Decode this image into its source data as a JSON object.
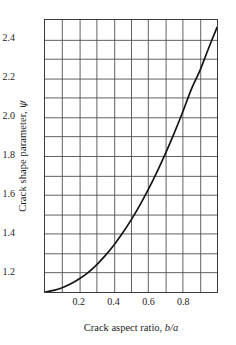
{
  "chart_data": {
    "type": "line",
    "title": "",
    "subtitle": "",
    "xlabel": "Crack aspect ratio, b/a",
    "xlabel_plain": "Crack aspect ratio, ",
    "xlabel_italic": "b/a",
    "ylabel": "Crack shape parameter, ψ",
    "ylabel_plain": "Crack shape parameter, ",
    "ylabel_symbol": "ψ",
    "xlim": [
      0,
      1.0
    ],
    "ylim": [
      1.1,
      2.5
    ],
    "grid": true,
    "grid_step_x": 0.1,
    "grid_step_y": 0.1,
    "legend": "none",
    "xticks": [
      0.2,
      0.4,
      0.6,
      0.8
    ],
    "xtick_labels": [
      "0.2",
      "0.4",
      "0.6",
      "0.8"
    ],
    "yticks": [
      1.2,
      1.4,
      1.6,
      1.8,
      2.0,
      2.2,
      2.4
    ],
    "ytick_labels": [
      "1.2",
      "1.4",
      "1.6",
      "1.8",
      "2.0",
      "2.2",
      "2.4"
    ],
    "series": [
      {
        "name": "crack shape parameter",
        "color": "#141414",
        "x": [
          0.0,
          0.05,
          0.1,
          0.15,
          0.2,
          0.25,
          0.3,
          0.35,
          0.4,
          0.45,
          0.5,
          0.55,
          0.6,
          0.65,
          0.7,
          0.75,
          0.8,
          0.85,
          0.9,
          0.95,
          1.0
        ],
        "y": [
          1.1,
          1.104,
          1.112,
          1.126,
          1.145,
          1.17,
          1.202,
          1.24,
          1.284,
          1.334,
          1.39,
          1.451,
          1.518,
          1.589,
          1.665,
          1.745,
          1.829,
          1.917,
          2.008,
          2.102,
          2.199
        ]
      }
    ],
    "curve_display": {
      "note": "rendered points mapped to plot box",
      "x": [
        0.0,
        0.05,
        0.1,
        0.15,
        0.2,
        0.25,
        0.3,
        0.35,
        0.4,
        0.45,
        0.5,
        0.55,
        0.6,
        0.65,
        0.7,
        0.75,
        0.8,
        0.85,
        0.9,
        0.95,
        1.0
      ],
      "y": [
        1.1,
        1.108,
        1.122,
        1.142,
        1.168,
        1.2,
        1.24,
        1.287,
        1.341,
        1.402,
        1.47,
        1.545,
        1.627,
        1.716,
        1.812,
        1.915,
        2.025,
        2.142,
        2.238,
        2.352,
        2.462
      ]
    },
    "colors": {
      "curve": "#141414",
      "grid": "#4d4d4d",
      "frame": "#3a3a3a",
      "text": "#1d1d1d",
      "background": "#ffffff"
    }
  }
}
